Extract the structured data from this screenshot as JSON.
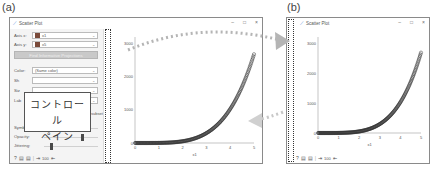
{
  "panels": {
    "a": {
      "label": "(a)"
    },
    "b": {
      "label": "(b)"
    }
  },
  "window": {
    "title": "Scatter Plot",
    "icon": "scatter-plot-icon",
    "controls": {
      "minimize": "–",
      "maximize": "□",
      "close": "×"
    }
  },
  "control_pane": {
    "axis_x": {
      "label": "Axis x:",
      "value": "x1"
    },
    "axis_y": {
      "label": "Axis y:",
      "value": "x5"
    },
    "find_button": "Find Informative Projections",
    "color": {
      "label": "Color:",
      "value": "(Same color)"
    },
    "shape_label": "Sh",
    "size_label": "Siz",
    "label_label": "Lab",
    "callout_line1": "コントロール",
    "callout_line2": "ペイン",
    "checkbox_label": "Label only selection and subset",
    "symbol_size": {
      "label": "Symbol size:",
      "position": 0.62
    },
    "opacity": {
      "label": "Opacity:",
      "position": 0.68
    },
    "jittering": {
      "label": "Jittering:",
      "position": 0.12
    },
    "toolbar": {
      "help": "?",
      "save": "▤",
      "report": "▤",
      "send": "⇥",
      "count": "100",
      "export": "⇤"
    }
  },
  "chart_data": {
    "type": "scatter",
    "title": "",
    "xlabel": "x1",
    "ylabel": "x5",
    "x_ticks": [
      "0",
      "1",
      "2",
      "3",
      "4",
      "5"
    ],
    "y_ticks": [
      "0",
      "1000",
      "2000",
      "3000"
    ],
    "xlim": [
      0,
      5
    ],
    "ylim": [
      0,
      3200
    ],
    "series": [
      {
        "name": "points",
        "x": [
          0,
          0.25,
          0.5,
          0.75,
          1,
          1.25,
          1.5,
          1.75,
          2,
          2.25,
          2.5,
          2.75,
          3,
          3.25,
          3.5,
          3.75,
          4,
          4.1,
          4.2,
          4.3,
          4.4,
          4.5,
          4.6,
          4.7,
          4.8,
          4.9,
          5
        ],
        "y": [
          0,
          0.1,
          0.4,
          1.7,
          5,
          11.3,
          23.4,
          43.2,
          73.5,
          117.8,
          179.5,
          262.7,
          372,
          512,
          689,
          908,
          1176,
          1290,
          1412,
          1541,
          1678,
          1823,
          1977,
          2139,
          2310,
          2490,
          2680
        ]
      }
    ],
    "grid": false
  },
  "annotations": {
    "arrow_forward": "collapse-control-pane",
    "arrow_back": "expand-control-pane"
  }
}
